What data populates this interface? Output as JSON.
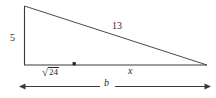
{
  "figure": {
    "type": "geometry-diagram",
    "shape": "right-triangle",
    "background_color": "#ffffff",
    "stroke_color": "#2b2b2b",
    "labels": {
      "leg_vertical": "5",
      "hypotenuse": "13",
      "segment_left": "24",
      "segment_left_radical": "√",
      "segment_right": "x",
      "base_total": "b"
    },
    "vertices": {
      "apex": [
        24,
        6
      ],
      "right_angle": [
        24,
        65
      ],
      "far_right": [
        207,
        65
      ]
    },
    "marker_point": [
      74,
      64
    ],
    "dimension_arrow": {
      "from": [
        21,
        86
      ],
      "to": [
        210,
        86
      ],
      "label": "b"
    }
  }
}
